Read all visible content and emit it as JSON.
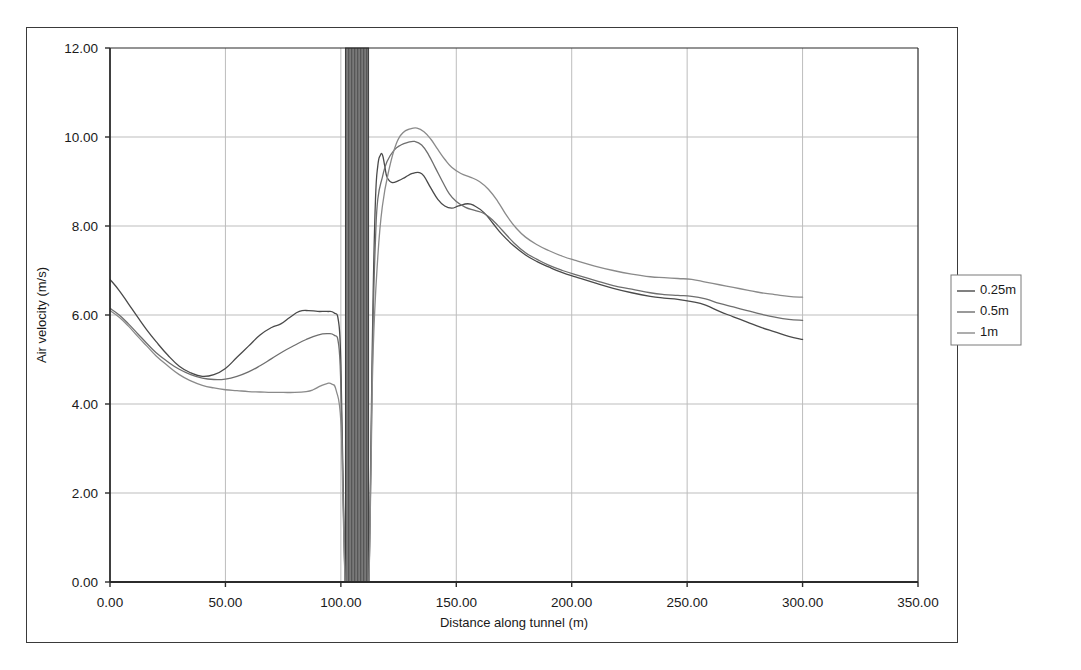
{
  "chart_data": {
    "type": "line",
    "title": "",
    "xlabel": "Distance along tunnel (m)",
    "ylabel": "Air velocity (m/s)",
    "xlim": [
      0,
      350
    ],
    "ylim": [
      0,
      12
    ],
    "xticks": [
      "0.00",
      "50.00",
      "100.00",
      "150.00",
      "200.00",
      "250.00",
      "300.00",
      "350.00"
    ],
    "yticks": [
      "0.00",
      "2.00",
      "4.00",
      "6.00",
      "8.00",
      "10.00",
      "12.00"
    ],
    "xtick_values": [
      0,
      50,
      100,
      150,
      200,
      250,
      300,
      350
    ],
    "ytick_values": [
      0,
      2,
      4,
      6,
      8,
      10,
      12
    ],
    "grid": true,
    "legend_position": "right",
    "obstruction": {
      "label": "tunnel-obstruction-band",
      "x_start": 102,
      "x_end": 112,
      "color": "#6b6b6b"
    },
    "series": [
      {
        "name": "0.25m",
        "color": "#4a4a4a",
        "points": [
          [
            0,
            6.8
          ],
          [
            4,
            6.55
          ],
          [
            8,
            6.25
          ],
          [
            12,
            5.95
          ],
          [
            16,
            5.66
          ],
          [
            20,
            5.4
          ],
          [
            25,
            5.1
          ],
          [
            30,
            4.85
          ],
          [
            35,
            4.7
          ],
          [
            40,
            4.62
          ],
          [
            45,
            4.66
          ],
          [
            50,
            4.8
          ],
          [
            55,
            5.05
          ],
          [
            60,
            5.3
          ],
          [
            65,
            5.55
          ],
          [
            70,
            5.72
          ],
          [
            74,
            5.8
          ],
          [
            78,
            5.95
          ],
          [
            82,
            6.08
          ],
          [
            86,
            6.1
          ],
          [
            90,
            6.08
          ],
          [
            94,
            6.08
          ],
          [
            97,
            6.05
          ],
          [
            99,
            5.85
          ],
          [
            100,
            4.9
          ],
          [
            101,
            2.2
          ],
          [
            101.8,
            0.0
          ],
          [
            112.2,
            0.0
          ],
          [
            113,
            3.0
          ],
          [
            114,
            6.5
          ],
          [
            115,
            8.6
          ],
          [
            116,
            9.35
          ],
          [
            117,
            9.58
          ],
          [
            118,
            9.6
          ],
          [
            119,
            9.35
          ],
          [
            120,
            9.1
          ],
          [
            122,
            8.98
          ],
          [
            125,
            9.02
          ],
          [
            128,
            9.1
          ],
          [
            131,
            9.18
          ],
          [
            134,
            9.2
          ],
          [
            136,
            9.12
          ],
          [
            139,
            8.85
          ],
          [
            142,
            8.6
          ],
          [
            145,
            8.45
          ],
          [
            148,
            8.4
          ],
          [
            151,
            8.45
          ],
          [
            155,
            8.5
          ],
          [
            158,
            8.45
          ],
          [
            162,
            8.3
          ],
          [
            166,
            8.05
          ],
          [
            170,
            7.8
          ],
          [
            175,
            7.55
          ],
          [
            180,
            7.35
          ],
          [
            185,
            7.2
          ],
          [
            190,
            7.08
          ],
          [
            196,
            6.95
          ],
          [
            202,
            6.85
          ],
          [
            210,
            6.72
          ],
          [
            218,
            6.6
          ],
          [
            226,
            6.5
          ],
          [
            234,
            6.42
          ],
          [
            240,
            6.38
          ],
          [
            246,
            6.35
          ],
          [
            252,
            6.3
          ],
          [
            258,
            6.22
          ],
          [
            264,
            6.08
          ],
          [
            270,
            5.96
          ],
          [
            276,
            5.84
          ],
          [
            282,
            5.72
          ],
          [
            288,
            5.62
          ],
          [
            294,
            5.52
          ],
          [
            300,
            5.45
          ]
        ]
      },
      {
        "name": "0.5m",
        "color": "#6e6e6e",
        "points": [
          [
            0,
            6.15
          ],
          [
            4,
            6.0
          ],
          [
            8,
            5.8
          ],
          [
            12,
            5.58
          ],
          [
            16,
            5.36
          ],
          [
            20,
            5.15
          ],
          [
            25,
            4.95
          ],
          [
            30,
            4.78
          ],
          [
            35,
            4.66
          ],
          [
            40,
            4.58
          ],
          [
            45,
            4.55
          ],
          [
            50,
            4.56
          ],
          [
            55,
            4.62
          ],
          [
            60,
            4.72
          ],
          [
            65,
            4.86
          ],
          [
            70,
            5.02
          ],
          [
            75,
            5.18
          ],
          [
            80,
            5.32
          ],
          [
            85,
            5.45
          ],
          [
            90,
            5.55
          ],
          [
            94,
            5.58
          ],
          [
            97,
            5.55
          ],
          [
            99,
            5.35
          ],
          [
            100,
            4.4
          ],
          [
            101,
            1.9
          ],
          [
            101.8,
            0.0
          ],
          [
            112.2,
            0.0
          ],
          [
            113,
            2.6
          ],
          [
            114,
            5.9
          ],
          [
            115,
            7.7
          ],
          [
            116,
            8.6
          ],
          [
            118,
            9.1
          ],
          [
            120,
            9.45
          ],
          [
            123,
            9.7
          ],
          [
            126,
            9.82
          ],
          [
            129,
            9.88
          ],
          [
            132,
            9.9
          ],
          [
            135,
            9.82
          ],
          [
            138,
            9.6
          ],
          [
            141,
            9.3
          ],
          [
            144,
            9.0
          ],
          [
            147,
            8.72
          ],
          [
            150,
            8.55
          ],
          [
            154,
            8.42
          ],
          [
            158,
            8.35
          ],
          [
            162,
            8.28
          ],
          [
            166,
            8.12
          ],
          [
            170,
            7.9
          ],
          [
            175,
            7.62
          ],
          [
            180,
            7.4
          ],
          [
            185,
            7.25
          ],
          [
            190,
            7.12
          ],
          [
            196,
            7.0
          ],
          [
            202,
            6.9
          ],
          [
            210,
            6.78
          ],
          [
            218,
            6.66
          ],
          [
            226,
            6.58
          ],
          [
            234,
            6.5
          ],
          [
            240,
            6.46
          ],
          [
            246,
            6.44
          ],
          [
            252,
            6.42
          ],
          [
            258,
            6.36
          ],
          [
            264,
            6.26
          ],
          [
            270,
            6.18
          ],
          [
            276,
            6.1
          ],
          [
            282,
            6.02
          ],
          [
            288,
            5.95
          ],
          [
            294,
            5.9
          ],
          [
            300,
            5.88
          ]
        ]
      },
      {
        "name": "1m",
        "color": "#8a8a8a",
        "points": [
          [
            0,
            6.1
          ],
          [
            4,
            5.95
          ],
          [
            8,
            5.75
          ],
          [
            12,
            5.52
          ],
          [
            16,
            5.3
          ],
          [
            20,
            5.08
          ],
          [
            25,
            4.86
          ],
          [
            30,
            4.66
          ],
          [
            35,
            4.52
          ],
          [
            40,
            4.42
          ],
          [
            45,
            4.36
          ],
          [
            50,
            4.32
          ],
          [
            55,
            4.3
          ],
          [
            60,
            4.28
          ],
          [
            65,
            4.27
          ],
          [
            70,
            4.26
          ],
          [
            75,
            4.26
          ],
          [
            80,
            4.26
          ],
          [
            85,
            4.28
          ],
          [
            88,
            4.32
          ],
          [
            91,
            4.4
          ],
          [
            94,
            4.46
          ],
          [
            96,
            4.45
          ],
          [
            98,
            4.3
          ],
          [
            100,
            3.6
          ],
          [
            101,
            1.6
          ],
          [
            101.8,
            0.0
          ],
          [
            112.2,
            0.0
          ],
          [
            113,
            2.3
          ],
          [
            114,
            5.2
          ],
          [
            116,
            7.3
          ],
          [
            118,
            8.45
          ],
          [
            121,
            9.3
          ],
          [
            124,
            9.85
          ],
          [
            127,
            10.1
          ],
          [
            130,
            10.18
          ],
          [
            133,
            10.2
          ],
          [
            136,
            10.12
          ],
          [
            139,
            9.95
          ],
          [
            142,
            9.72
          ],
          [
            145,
            9.5
          ],
          [
            148,
            9.32
          ],
          [
            152,
            9.18
          ],
          [
            156,
            9.1
          ],
          [
            160,
            9.0
          ],
          [
            164,
            8.82
          ],
          [
            168,
            8.55
          ],
          [
            172,
            8.22
          ],
          [
            176,
            7.95
          ],
          [
            180,
            7.75
          ],
          [
            185,
            7.58
          ],
          [
            190,
            7.45
          ],
          [
            196,
            7.32
          ],
          [
            202,
            7.22
          ],
          [
            210,
            7.1
          ],
          [
            218,
            7.0
          ],
          [
            226,
            6.92
          ],
          [
            234,
            6.86
          ],
          [
            240,
            6.84
          ],
          [
            246,
            6.82
          ],
          [
            252,
            6.8
          ],
          [
            258,
            6.74
          ],
          [
            264,
            6.68
          ],
          [
            270,
            6.62
          ],
          [
            276,
            6.56
          ],
          [
            282,
            6.5
          ],
          [
            288,
            6.46
          ],
          [
            294,
            6.42
          ],
          [
            300,
            6.4
          ]
        ]
      }
    ]
  }
}
